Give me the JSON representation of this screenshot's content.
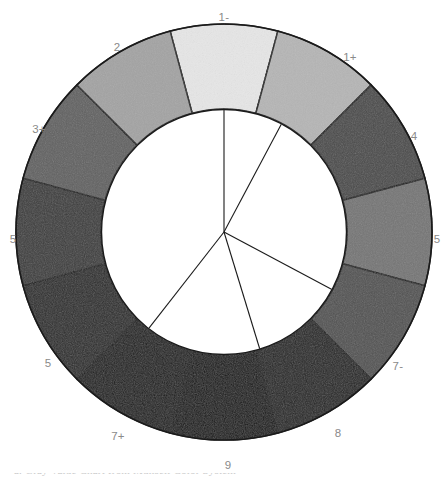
{
  "figure": {
    "background_color": "#ffffff",
    "outline_color": "#1a1a1a",
    "label_color": "#8a8a8a",
    "hub_fill": "#ffffff"
  },
  "chart_data": {
    "type": "pie",
    "subtitle": "",
    "xlabel": "",
    "ylabel": "",
    "legend_position": "none",
    "grid": false,
    "shape": "annulus",
    "segment_count": 12,
    "segment_arc_degrees": 30,
    "start_angle_degrees": -15,
    "outer_radius": 208,
    "inner_radius": 123,
    "center_x": 224,
    "center_y": 232,
    "categories": [
      "1-",
      "1+",
      "4",
      "5",
      "7-",
      "8",
      "9",
      "7+",
      "5",
      "5",
      "3+",
      "2"
    ],
    "values": [
      91,
      72,
      29,
      46,
      32,
      13,
      8,
      11,
      17,
      24,
      38,
      65
    ],
    "labels": [
      "1-",
      "1+",
      "4",
      "5",
      "7-",
      "8",
      "9",
      "7+",
      "5",
      "5",
      "3+",
      "2"
    ],
    "colors": [
      "#e6e6e6",
      "#b5b5b5",
      "#4a4a4a",
      "#757575",
      "#525252",
      "#232323",
      "#141414",
      "#1c1c1c",
      "#2b2b2b",
      "#3c3c3c",
      "#616161",
      "#a3a3a3"
    ],
    "segments": [
      {
        "label": "1-",
        "color": "#e6e6e6",
        "value": 91,
        "angle_mid": 0
      },
      {
        "label": "1+",
        "color": "#b5b5b5",
        "value": 72,
        "angle_mid": 30
      },
      {
        "label": "4",
        "color": "#4a4a4a",
        "value": 29,
        "angle_mid": 60
      },
      {
        "label": "5",
        "color": "#757575",
        "value": 46,
        "angle_mid": 90
      },
      {
        "label": "7-",
        "color": "#525252",
        "value": 32,
        "angle_mid": 120
      },
      {
        "label": "8",
        "color": "#232323",
        "value": 13,
        "angle_mid": 150
      },
      {
        "label": "9",
        "color": "#141414",
        "value": 8,
        "angle_mid": 180
      },
      {
        "label": "7+",
        "color": "#1c1c1c",
        "value": 11,
        "angle_mid": 210
      },
      {
        "label": "5",
        "color": "#2b2b2b",
        "value": 17,
        "angle_mid": 240
      },
      {
        "label": "5",
        "color": "#3c3c3c",
        "value": 24,
        "angle_mid": 270
      },
      {
        "label": "3+",
        "color": "#616161",
        "value": 38,
        "angle_mid": 300
      },
      {
        "label": "2",
        "color": "#a3a3a3",
        "value": 65,
        "angle_mid": 330
      }
    ],
    "hub_spokes_degrees": [
      0,
      28,
      118,
      163,
      218
    ],
    "annotations": []
  },
  "ring_labels": [
    {
      "text": "1-",
      "x": 224,
      "y": 18
    },
    {
      "text": "1+",
      "x": 350,
      "y": 58
    },
    {
      "text": "4",
      "x": 414,
      "y": 137
    },
    {
      "text": "5",
      "x": 437,
      "y": 240
    },
    {
      "text": "7-",
      "x": 398,
      "y": 367
    },
    {
      "text": "8",
      "x": 338,
      "y": 434
    },
    {
      "text": "9",
      "x": 228,
      "y": 466
    },
    {
      "text": "7+",
      "x": 118,
      "y": 437
    },
    {
      "text": "5",
      "x": 48,
      "y": 364
    },
    {
      "text": "5",
      "x": 13,
      "y": 240
    },
    {
      "text": "3+",
      "x": 39,
      "y": 130
    },
    {
      "text": "2",
      "x": 117,
      "y": 48
    }
  ],
  "caption": {
    "text": "a. Gray Value Chart from Munsell Color System"
  }
}
